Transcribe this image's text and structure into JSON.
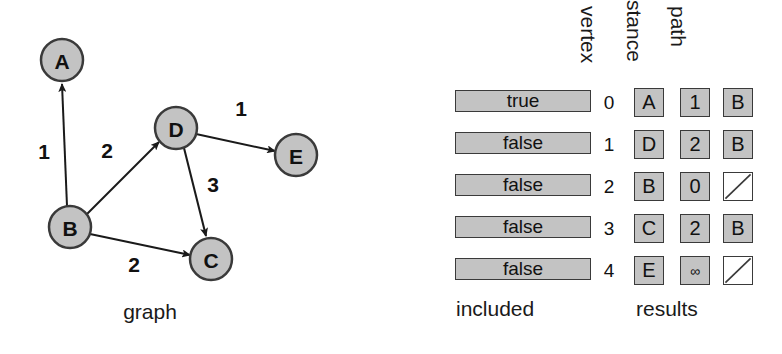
{
  "graph": {
    "caption": "graph",
    "nodes": [
      {
        "id": "A",
        "label": "A",
        "cx": 62,
        "cy": 60,
        "r": 21
      },
      {
        "id": "B",
        "label": "B",
        "cx": 70,
        "cy": 227,
        "r": 21
      },
      {
        "id": "C",
        "label": "C",
        "cx": 211,
        "cy": 259,
        "r": 21
      },
      {
        "id": "D",
        "label": "D",
        "cx": 176,
        "cy": 128,
        "r": 21
      },
      {
        "id": "E",
        "label": "E",
        "cx": 296,
        "cy": 155,
        "r": 21
      }
    ],
    "edges": [
      {
        "from": "B",
        "to": "A",
        "weight": "1",
        "lx": 44,
        "ly": 152
      },
      {
        "from": "B",
        "to": "D",
        "weight": "2",
        "lx": 107,
        "ly": 151
      },
      {
        "from": "B",
        "to": "C",
        "weight": "2",
        "lx": 134,
        "ly": 265
      },
      {
        "from": "D",
        "to": "C",
        "weight": "3",
        "lx": 213,
        "ly": 185
      },
      {
        "from": "D",
        "to": "E",
        "weight": "1",
        "lx": 241,
        "ly": 109
      }
    ],
    "node_fill": "#c3c3c3",
    "node_stroke": "#3a3a3a",
    "edge_stroke": "#1a1a1a"
  },
  "table": {
    "included_caption": "included",
    "results_caption": "results",
    "headers": {
      "vertex": "vertex",
      "distance": "stance",
      "path": "path"
    },
    "rows": [
      {
        "index": "0",
        "included": "true",
        "vertex": "A",
        "distance": "1",
        "path": "B",
        "path_empty": false
      },
      {
        "index": "1",
        "included": "false",
        "vertex": "D",
        "distance": "2",
        "path": "B",
        "path_empty": false
      },
      {
        "index": "2",
        "included": "false",
        "vertex": "B",
        "distance": "0",
        "path": "",
        "path_empty": true
      },
      {
        "index": "3",
        "included": "false",
        "vertex": "C",
        "distance": "2",
        "path": "B",
        "path_empty": false
      },
      {
        "index": "4",
        "included": "false",
        "vertex": "E",
        "distance": "∞",
        "path": "",
        "path_empty": true
      }
    ],
    "cell_fill": "#c3c3c3",
    "cell_stroke": "#3a3a3a"
  }
}
